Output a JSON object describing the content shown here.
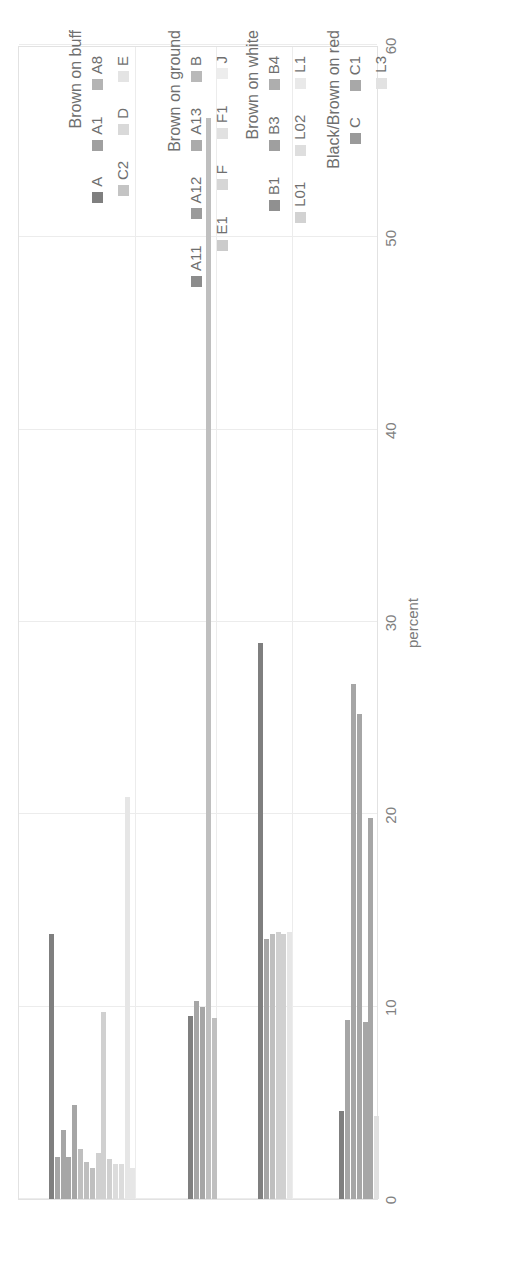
{
  "chart_data": {
    "type": "bar",
    "title": "",
    "xlabel": "",
    "ylabel": "percent",
    "orientation": "vertical-bars-rotated",
    "ylim": [
      0,
      60
    ],
    "yticks": [
      0,
      10,
      20,
      30,
      40,
      50,
      60
    ],
    "ytick_labels": [
      "0",
      "10",
      "20",
      "30",
      "40",
      "50",
      "60"
    ],
    "grid": true,
    "legend_position": "below-plot",
    "groups": [
      {
        "name": "Brown on buff",
        "categories": [
          "A",
          "A1",
          "A8",
          "C2",
          "D",
          "E"
        ],
        "series": [
          {
            "name": "A",
            "color": "#7f7f7f",
            "values": [
              13.8
            ]
          },
          {
            "name": "A1",
            "color": "#a6a6a6",
            "values": [
              2.2,
              3.6,
              2.2,
              4.9
            ]
          },
          {
            "name": "A8",
            "color": "#bfbfbf",
            "values": [
              2.6,
              1.9,
              1.6
            ]
          },
          {
            "name": "C2",
            "color": "#d0d0d0",
            "values": [
              2.4,
              9.7,
              2.1
            ]
          },
          {
            "name": "D",
            "color": "#dcdcdc",
            "values": [
              1.8,
              1.8
            ]
          },
          {
            "name": "E",
            "color": "#e6e6e6",
            "values": [
              20.9,
              1.6
            ]
          }
        ],
        "bar_values": [
          13.8,
          2.2,
          3.6,
          2.2,
          4.9,
          2.6,
          1.9,
          1.6,
          2.4,
          9.7,
          2.1,
          1.8,
          1.8,
          20.9,
          1.6
        ]
      },
      {
        "name": "Brown on ground",
        "categories": [
          "A11",
          "A12",
          "A13",
          "B",
          "E1",
          "F",
          "F1",
          "J"
        ],
        "series": [
          {
            "name": "A11",
            "color": "#7f7f7f",
            "values": [
              9.5
            ]
          },
          {
            "name": "A12",
            "color": "#a6a6a6",
            "values": [
              10.3,
              10.0
            ]
          },
          {
            "name": "A13",
            "color": "#bfbfbf",
            "values": [
              56.2,
              9.4
            ]
          },
          {
            "name": "B",
            "color": "#d0d0d0",
            "values": []
          },
          {
            "name": "E1",
            "color": "#dcdcdc",
            "values": []
          },
          {
            "name": "F",
            "color": "#e6e6e6",
            "values": []
          },
          {
            "name": "F1",
            "color": "#ededed",
            "values": []
          },
          {
            "name": "J",
            "color": "#f2f2f2",
            "values": []
          }
        ],
        "bar_values": [
          9.5,
          10.3,
          10.0,
          56.2,
          9.4
        ]
      },
      {
        "name": "Brown on white",
        "categories": [
          "B1",
          "B3",
          "B4",
          "L01",
          "L02",
          "L1"
        ],
        "series": [
          {
            "name": "B1",
            "color": "#7f7f7f",
            "values": [
              28.9
            ]
          },
          {
            "name": "B3",
            "color": "#a6a6a6",
            "values": [
              13.5
            ]
          },
          {
            "name": "B4",
            "color": "#bfbfbf",
            "values": [
              13.8
            ]
          },
          {
            "name": "L01",
            "color": "#d0d0d0",
            "values": [
              13.9,
              13.8
            ]
          },
          {
            "name": "L02",
            "color": "#dcdcdc",
            "values": []
          },
          {
            "name": "L1",
            "color": "#e6e6e6",
            "values": [
              13.9
            ]
          }
        ],
        "bar_values": [
          28.9,
          13.5,
          13.8,
          13.9,
          13.8,
          13.9
        ]
      },
      {
        "name": "Black/Brown on red",
        "categories": [
          "C",
          "C1",
          "L3"
        ],
        "series": [
          {
            "name": "C",
            "color": "#7f7f7f",
            "values": [
              4.6
            ]
          },
          {
            "name": "C1",
            "color": "#a6a6a6",
            "values": [
              9.3,
              26.8,
              25.2,
              9.2,
              19.8
            ]
          },
          {
            "name": "L3",
            "color": "#e0e0e0",
            "values": [
              4.3
            ]
          }
        ],
        "bar_values": [
          4.6,
          9.3,
          26.8,
          25.2,
          9.2,
          19.8,
          4.3
        ]
      }
    ]
  },
  "axis": {
    "title": "percent",
    "tick_labels": [
      "60",
      "50",
      "40",
      "30",
      "20",
      "10",
      "0"
    ]
  },
  "groups": [
    {
      "caption": "Brown on buff"
    },
    {
      "caption": "Brown on ground"
    },
    {
      "caption": "Brown on white"
    },
    {
      "caption": "Black/Brown on red"
    }
  ],
  "legend": {
    "buff": {
      "row1": [
        {
          "label": "A",
          "color": "#7f7f7f"
        },
        {
          "label": "A1",
          "color": "#a0a0a0"
        },
        {
          "label": "A8",
          "color": "#b4b4b4"
        }
      ],
      "row2": [
        {
          "label": "C2",
          "color": "#c4c4c4"
        },
        {
          "label": "D",
          "color": "#d9d9d9"
        },
        {
          "label": "E",
          "color": "#e4e4e4"
        }
      ]
    },
    "ground": {
      "row1": [
        {
          "label": "A11",
          "color": "#8c8c8c"
        },
        {
          "label": "A12",
          "color": "#9b9b9b"
        },
        {
          "label": "A13",
          "color": "#ababab"
        },
        {
          "label": "B",
          "color": "#b9b9b9"
        }
      ],
      "row2": [
        {
          "label": "E1",
          "color": "#cbcbcb"
        },
        {
          "label": "F",
          "color": "#d6d6d6"
        },
        {
          "label": "F1",
          "color": "#e1e1e1"
        },
        {
          "label": "J",
          "color": "#ededed"
        }
      ]
    },
    "white": {
      "row1": [
        {
          "label": "B1",
          "color": "#909090"
        },
        {
          "label": "B3",
          "color": "#9f9f9f"
        },
        {
          "label": "B4",
          "color": "#aeaeae"
        }
      ],
      "row2": [
        {
          "label": "L01",
          "color": "#d2d2d2"
        },
        {
          "label": "L02",
          "color": "#dedede"
        },
        {
          "label": "L1",
          "color": "#e9e9e9"
        }
      ]
    },
    "red": {
      "row1": [
        {
          "label": "C",
          "color": "#9a9a9a"
        },
        {
          "label": "C1",
          "color": "#a8a8a8"
        }
      ],
      "row2": [
        {
          "label": "L3",
          "color": "#e2e2e2"
        }
      ]
    }
  }
}
